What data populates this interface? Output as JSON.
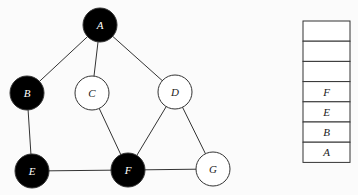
{
  "graph": {
    "nodes": [
      {
        "id": "A",
        "label": "A",
        "x": 100,
        "y": 25,
        "filled": true
      },
      {
        "id": "B",
        "label": "B",
        "x": 27,
        "y": 93,
        "filled": true
      },
      {
        "id": "C",
        "label": "C",
        "x": 92,
        "y": 93,
        "filled": false
      },
      {
        "id": "D",
        "label": "D",
        "x": 175,
        "y": 92,
        "filled": false
      },
      {
        "id": "E",
        "label": "E",
        "x": 32,
        "y": 171,
        "filled": true
      },
      {
        "id": "F",
        "label": "F",
        "x": 128,
        "y": 170,
        "filled": true
      },
      {
        "id": "G",
        "label": "G",
        "x": 213,
        "y": 169,
        "filled": false
      }
    ],
    "edges": [
      [
        "A",
        "B"
      ],
      [
        "A",
        "C"
      ],
      [
        "A",
        "D"
      ],
      [
        "B",
        "E"
      ],
      [
        "C",
        "F"
      ],
      [
        "D",
        "F"
      ],
      [
        "D",
        "G"
      ],
      [
        "E",
        "F"
      ],
      [
        "F",
        "G"
      ]
    ]
  },
  "stack": {
    "cells": [
      "",
      "",
      "",
      "F",
      "E",
      "B",
      "A"
    ]
  },
  "colors": {
    "filled": "#000000",
    "empty": "#ffffff",
    "stroke": "#333333",
    "filled_text": "#ffffff",
    "empty_text": "#222222"
  }
}
